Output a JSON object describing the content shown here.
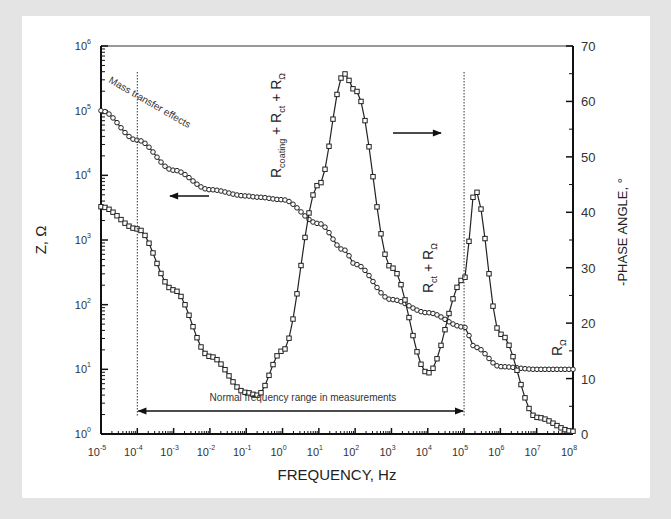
{
  "chart_data": {
    "type": "line",
    "title": "",
    "xlabel": "FREQUENCY, Hz",
    "ylabel": "Z, Ω",
    "ylabel_right": "-PHASE ANGLE, °",
    "xscale": "log",
    "yscale": "log",
    "xlim": [
      1e-05,
      100000000.0
    ],
    "ylim": [
      1,
      1000000
    ],
    "ylim_right": [
      0,
      70
    ],
    "grid": false,
    "x_tick_labels": [
      "10-5",
      "10-4",
      "10-3",
      "10-2",
      "10-1",
      "100",
      "101",
      "102",
      "103",
      "104",
      "105",
      "106",
      "107",
      "108"
    ],
    "x_tick_exponents": [
      -5,
      -4,
      -3,
      -2,
      -1,
      0,
      1,
      2,
      3,
      4,
      5,
      6,
      7,
      8
    ],
    "y_tick_exponents": [
      0,
      1,
      2,
      3,
      4,
      5,
      6
    ],
    "y_right_ticks": [
      0,
      10,
      20,
      30,
      40,
      50,
      60,
      70
    ],
    "x": [
      1e-05,
      0.0001,
      0.001,
      0.01,
      0.1,
      0.2,
      1.0,
      10.0,
      50.0,
      100.0,
      1000.0,
      10000.0,
      100000.0,
      200000.0,
      1000000.0,
      10000000.0,
      100000000.0
    ],
    "series": [
      {
        "name": "|Z| (impedance modulus)",
        "marker": "circle",
        "axis": "left",
        "values": [
          100000,
          35000,
          12000,
          6000,
          4800,
          4600,
          4200,
          1800,
          700,
          420,
          120,
          75,
          45,
          22,
          11,
          10,
          10
        ]
      },
      {
        "name": "-Phase angle",
        "marker": "square",
        "axis": "right",
        "values": [
          41,
          37,
          26,
          14,
          7.5,
          7,
          15,
          45,
          65,
          62,
          30,
          11,
          28,
          44,
          18,
          3,
          0.5
        ]
      }
    ],
    "annotations": [
      {
        "text": "Mass transfer effects",
        "x": 2e-05,
        "y": 60000
      },
      {
        "text": "R_coating + R_ct + R_Ω",
        "x": 2,
        "orientation": "vertical"
      },
      {
        "text": "R_ct + R_Ω",
        "x": 20000.0,
        "orientation": "vertical"
      },
      {
        "text": "R_Ω",
        "x": 50000000.0,
        "orientation": "vertical"
      },
      {
        "text": "Normal frequency range in measurements",
        "x_range": [
          0.0001,
          100000.0
        ]
      }
    ],
    "legend": "none (arrows indicate axis: left arrow -> Z, right arrow -> phase)"
  },
  "labels": {
    "x_axis_title": "FREQUENCY, Hz",
    "y_axis_title": "Z, Ω",
    "y2_axis_title": "-PHASE ANGLE, °",
    "mass_transfer": "Mass transfer effects",
    "range_text": "Normal frequency range in measurements",
    "r_coating_main": "R",
    "r_coating_sub": "coating",
    "r_ct_main": "R",
    "r_ct_sub": "ct",
    "r_omega_main": "R",
    "r_omega_sub": "Ω",
    "plus": " + "
  }
}
